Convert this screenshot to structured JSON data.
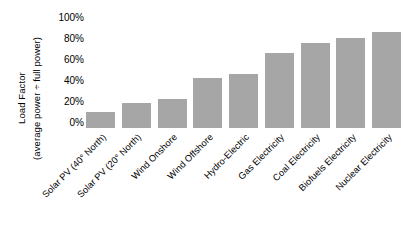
{
  "chart_data": {
    "type": "bar",
    "title": "",
    "subtitle": "",
    "xlabel": "",
    "ylabel": "Load Factor (average power ÷ full power)",
    "ylabel_line1": "Load Factor",
    "ylabel_line2": "(average power ÷ full power)",
    "categories": [
      "Solar PV (40° North)",
      "Solar PV (20° North)",
      "Wind Onshore",
      "Wind Offshore",
      "Hydro-Electric",
      "Gas Electricity",
      "Coal Electricity",
      "Biofuels Electricity",
      "Nuclear Electricity"
    ],
    "values": [
      15,
      24,
      28,
      48,
      51,
      71,
      81,
      86,
      91
    ],
    "value_unit": "%",
    "ylim": [
      0,
      100
    ],
    "ytick_values": [
      100,
      80,
      60,
      40,
      20,
      0
    ],
    "ytick_labels": [
      "100%",
      "80%",
      "60%",
      "40%",
      "20%",
      "0%"
    ],
    "grid": false,
    "legend": false,
    "legend_position": "none",
    "bar_color": "#a6a6a6",
    "background_color": "#ffffff",
    "text_color": "#000000"
  }
}
